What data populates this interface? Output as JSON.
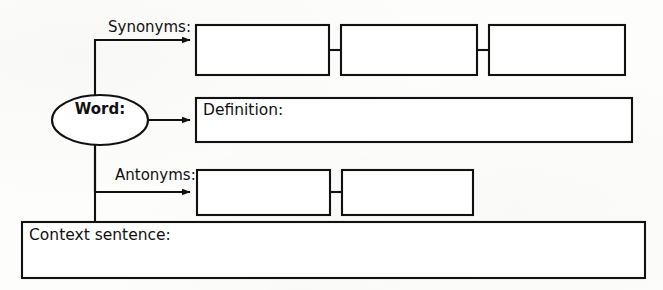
{
  "document": {
    "title": "Word Graphic Organizer",
    "type": "worksheet-diagram",
    "background_color": "#fdfdfc",
    "ink_color": "#111111"
  },
  "central_node": {
    "name": "word-node",
    "label": "Word:",
    "shape": "ellipse",
    "bold": true
  },
  "branches": [
    {
      "key": "synonyms",
      "label": "Synonyms:",
      "label_position": "above-left-of-boxes",
      "box_count": 3,
      "boxes": [
        {
          "name": "synonym-box-1",
          "value": ""
        },
        {
          "name": "synonym-box-2",
          "value": ""
        },
        {
          "name": "synonym-box-3",
          "value": ""
        }
      ]
    },
    {
      "key": "definition",
      "label": "Definition:",
      "label_position": "inside-box",
      "box_count": 1,
      "boxes": [
        {
          "name": "definition-box",
          "value": ""
        }
      ]
    },
    {
      "key": "antonyms",
      "label": "Antonyms:",
      "label_position": "above-left-of-boxes",
      "box_count": 2,
      "boxes": [
        {
          "name": "antonym-box-1",
          "value": ""
        },
        {
          "name": "antonym-box-2",
          "value": ""
        }
      ]
    },
    {
      "key": "context_sentence",
      "label": "Context sentence:",
      "label_position": "inside-box",
      "box_count": 1,
      "boxes": [
        {
          "name": "context-sentence-box",
          "value": ""
        }
      ]
    }
  ],
  "labels": {
    "synonyms": "Synonyms:",
    "definition": "Definition:",
    "antonyms": "Antonyms:",
    "context_sentence": "Context sentence:",
    "word": "Word:"
  }
}
